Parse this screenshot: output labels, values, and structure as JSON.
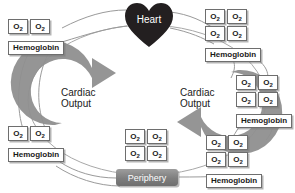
{
  "diagram": {
    "type": "circulation-cycle",
    "nodes": {
      "heart": {
        "label": "Heart",
        "shape": "heart",
        "color": "#231f20",
        "text_color": "#ffffff"
      },
      "periphery": {
        "label": "Periphery",
        "shape": "rounded-rect",
        "color": "#7e7e7e",
        "text_color": "#ffffff"
      }
    },
    "arrows": [
      {
        "id": "cardiac-output-left",
        "label": "Cardiac\nOutput",
        "direction": "upward",
        "color": "#8c8c8c"
      },
      {
        "id": "cardiac-output-right",
        "label": "Cardiac\nOutput",
        "direction": "downward",
        "color": "#8c8c8c"
      }
    ],
    "molecule_label": "Hemoglobin",
    "o2_label": "O",
    "o2_subscript": "2",
    "groups": [
      {
        "id": "top-left",
        "o2_count": 2,
        "rows": [
          2
        ],
        "carrier": "Hemoglobin"
      },
      {
        "id": "top-right",
        "o2_count": 4,
        "rows": [
          2,
          2
        ],
        "carrier": "Hemoglobin"
      },
      {
        "id": "middle-right",
        "o2_count": 4,
        "rows": [
          2,
          2
        ],
        "carrier": "Hemoglobin"
      },
      {
        "id": "bottom-right",
        "o2_count": 4,
        "rows": [
          2,
          2
        ],
        "carrier": "Hemoglobin"
      },
      {
        "id": "bottom-left",
        "o2_count": 2,
        "rows": [
          2
        ],
        "carrier": "Hemoglobin"
      },
      {
        "id": "center-free",
        "o2_count": 4,
        "rows": [
          2,
          2
        ],
        "carrier": null
      }
    ],
    "colors": {
      "box_border": "#6e6e6e",
      "box_fill": "#ffffff",
      "arrow": "#8c8c8c",
      "connector": "#8c8c8c",
      "heart": "#231f20",
      "periphery": "#7e7e7e",
      "text": "#1a1a1a"
    }
  }
}
